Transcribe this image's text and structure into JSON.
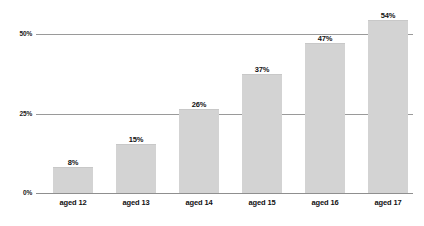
{
  "chart_data": {
    "type": "bar",
    "title": "",
    "subtitle": "",
    "xlabel": "",
    "ylabel": "",
    "categories": [
      "aged 12",
      "aged 13",
      "aged 14",
      "aged 15",
      "aged 16",
      "aged 17"
    ],
    "values": [
      8,
      15,
      26,
      37,
      47,
      54
    ],
    "value_labels": [
      "8%",
      "15%",
      "26%",
      "37%",
      "47%",
      "54%"
    ],
    "ylim": [
      0,
      60
    ],
    "yticks": [
      0,
      25,
      50
    ],
    "ytick_labels": [
      "0%",
      "25%",
      "50%"
    ],
    "grid": true,
    "legend": false,
    "legend_position": "none",
    "series": [
      {
        "name": "",
        "values": [
          8,
          15,
          26,
          37,
          47,
          54
        ]
      }
    ],
    "colors": {
      "bar_fill": "#d3d3d3",
      "gridline": "#9a9a9a",
      "text": "#111111",
      "background": "#ffffff"
    }
  }
}
